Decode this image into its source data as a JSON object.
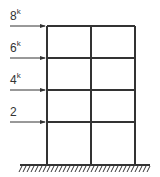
{
  "diagram": {
    "type": "structural-frame",
    "bays": 2,
    "stories": 4,
    "loads": [
      {
        "value": "8",
        "unit": "k",
        "level": 4
      },
      {
        "value": "6",
        "unit": "k",
        "level": 3
      },
      {
        "value": "4",
        "unit": "k",
        "level": 2
      },
      {
        "value": "2",
        "unit": "",
        "level": 1
      }
    ],
    "support": "fixed-ground",
    "colors": {
      "line": "#333333",
      "background": "#ffffff"
    }
  }
}
